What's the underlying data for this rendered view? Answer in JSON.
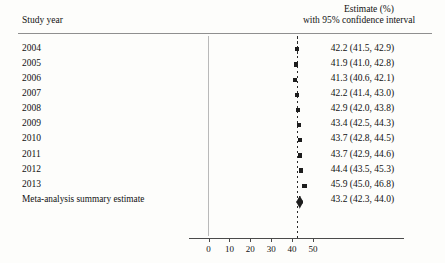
{
  "header": {
    "left_label": "Study year",
    "right_label_line1": "Estimate (%)",
    "right_label_line2": "with 95% confidence interval"
  },
  "axis": {
    "ticks": [
      0,
      10,
      20,
      30,
      40,
      50
    ],
    "tick_labels": [
      "0",
      "10",
      "20",
      "30",
      "40",
      "50"
    ]
  },
  "chart_data": {
    "type": "forest",
    "title": "",
    "xlabel": "",
    "ylabel": "",
    "xlim": [
      0,
      52
    ],
    "grid": false,
    "reference_line": 43.2,
    "categories": [
      "2004",
      "2005",
      "2006",
      "2007",
      "2008",
      "2009",
      "2010",
      "2011",
      "2012",
      "2013",
      "Meta-analysis summary estimate"
    ],
    "estimates": [
      42.2,
      41.9,
      41.3,
      42.2,
      42.9,
      43.4,
      43.7,
      43.7,
      44.4,
      45.9,
      43.2
    ],
    "ci_lower": [
      41.5,
      41.0,
      40.6,
      41.4,
      42.0,
      42.5,
      42.8,
      42.9,
      43.5,
      45.0,
      42.3
    ],
    "ci_upper": [
      42.9,
      42.8,
      42.1,
      43.0,
      43.8,
      44.3,
      44.5,
      44.6,
      45.3,
      46.8,
      44.0
    ],
    "is_summary": [
      false,
      false,
      false,
      false,
      false,
      false,
      false,
      false,
      false,
      false,
      true
    ],
    "rows": [
      {
        "label": "2004",
        "estimate": 42.2,
        "lower": 41.5,
        "upper": 42.9,
        "text": "42.2 (41.5, 42.9)",
        "summary": false
      },
      {
        "label": "2005",
        "estimate": 41.9,
        "lower": 41.0,
        "upper": 42.8,
        "text": "41.9 (41.0, 42.8)",
        "summary": false
      },
      {
        "label": "2006",
        "estimate": 41.3,
        "lower": 40.6,
        "upper": 42.1,
        "text": "41.3 (40.6, 42.1)",
        "summary": false
      },
      {
        "label": "2007",
        "estimate": 42.2,
        "lower": 41.4,
        "upper": 43.0,
        "text": "42.2 (41.4, 43.0)",
        "summary": false
      },
      {
        "label": "2008",
        "estimate": 42.9,
        "lower": 42.0,
        "upper": 43.8,
        "text": "42.9 (42.0, 43.8)",
        "summary": false
      },
      {
        "label": "2009",
        "estimate": 43.4,
        "lower": 42.5,
        "upper": 44.3,
        "text": "43.4 (42.5, 44.3)",
        "summary": false
      },
      {
        "label": "2010",
        "estimate": 43.7,
        "lower": 42.8,
        "upper": 44.5,
        "text": "43.7 (42.8, 44.5)",
        "summary": false
      },
      {
        "label": "2011",
        "estimate": 43.7,
        "lower": 42.9,
        "upper": 44.6,
        "text": "43.7 (42.9, 44.6)",
        "summary": false
      },
      {
        "label": "2012",
        "estimate": 44.4,
        "lower": 43.5,
        "upper": 45.3,
        "text": "44.4 (43.5, 45.3)",
        "summary": false
      },
      {
        "label": "2013",
        "estimate": 45.9,
        "lower": 45.0,
        "upper": 46.8,
        "text": "45.9 (45.0, 46.8)",
        "summary": false
      },
      {
        "label": "Meta-analysis summary estimate",
        "estimate": 43.2,
        "lower": 42.3,
        "upper": 44.0,
        "text": "43.2 (42.3, 44.0)",
        "summary": true
      }
    ]
  }
}
